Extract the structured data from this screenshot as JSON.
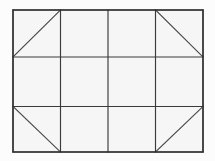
{
  "figure": {
    "shape_type": "grid-diagram",
    "canvas": {
      "width": 215,
      "height": 161,
      "background_color": "#fcfcfc"
    },
    "outer_rectangle": {
      "name": "outer-border",
      "x": 13,
      "y": 10,
      "width": 190,
      "height": 142,
      "stroke_color": "#2e2e2e",
      "fill_color": "#f6f6f6"
    },
    "grid": {
      "columns": 4,
      "rows": 3,
      "vertical_line_x": [
        13,
        60.5,
        108,
        155.5,
        203
      ],
      "horizontal_line_y": [
        10,
        57,
        106.5,
        152
      ],
      "line_color": "#3a3a3a"
    },
    "cells": [
      {
        "id": "r0c0",
        "row": 0,
        "col": 0,
        "x": 13,
        "y": 10,
        "width": 47.5,
        "height": 47,
        "diagonal": "bottom-left-to-top-right"
      },
      {
        "id": "r0c1",
        "row": 0,
        "col": 1,
        "x": 60.5,
        "y": 10,
        "width": 47.5,
        "height": 47,
        "diagonal": "none"
      },
      {
        "id": "r0c2",
        "row": 0,
        "col": 2,
        "x": 108,
        "y": 10,
        "width": 47.5,
        "height": 47,
        "diagonal": "none"
      },
      {
        "id": "r0c3",
        "row": 0,
        "col": 3,
        "x": 155.5,
        "y": 10,
        "width": 47.5,
        "height": 47,
        "diagonal": "top-left-to-bottom-right"
      },
      {
        "id": "r1c0",
        "row": 1,
        "col": 0,
        "x": 13,
        "y": 57,
        "width": 47.5,
        "height": 49.5,
        "diagonal": "none"
      },
      {
        "id": "r1c1",
        "row": 1,
        "col": 1,
        "x": 60.5,
        "y": 57,
        "width": 47.5,
        "height": 49.5,
        "diagonal": "none"
      },
      {
        "id": "r1c2",
        "row": 1,
        "col": 2,
        "x": 108,
        "y": 57,
        "width": 47.5,
        "height": 49.5,
        "diagonal": "none"
      },
      {
        "id": "r1c3",
        "row": 1,
        "col": 3,
        "x": 155.5,
        "y": 57,
        "width": 47.5,
        "height": 49.5,
        "diagonal": "none"
      },
      {
        "id": "r2c0",
        "row": 2,
        "col": 0,
        "x": 13,
        "y": 106.5,
        "width": 47.5,
        "height": 45.5,
        "diagonal": "top-left-to-bottom-right"
      },
      {
        "id": "r2c1",
        "row": 2,
        "col": 1,
        "x": 60.5,
        "y": 106.5,
        "width": 47.5,
        "height": 45.5,
        "diagonal": "none"
      },
      {
        "id": "r2c2",
        "row": 2,
        "col": 2,
        "x": 108,
        "y": 106.5,
        "width": 47.5,
        "height": 45.5,
        "diagonal": "none"
      },
      {
        "id": "r2c3",
        "row": 2,
        "col": 3,
        "x": 155.5,
        "y": 106.5,
        "width": 47.5,
        "height": 45.5,
        "diagonal": "bottom-left-to-top-right"
      }
    ],
    "diagonals": [
      {
        "name": "diagonal-top-left-cell",
        "x1": 13,
        "y1": 57,
        "x2": 60.5,
        "y2": 10
      },
      {
        "name": "diagonal-top-right-cell",
        "x1": 155.5,
        "y1": 10,
        "x2": 203,
        "y2": 57
      },
      {
        "name": "diagonal-bottom-left-cell",
        "x1": 13,
        "y1": 106.5,
        "x2": 60.5,
        "y2": 152
      },
      {
        "name": "diagonal-bottom-right-cell",
        "x1": 155.5,
        "y1": 152,
        "x2": 203,
        "y2": 106.5
      }
    ],
    "labels": []
  }
}
